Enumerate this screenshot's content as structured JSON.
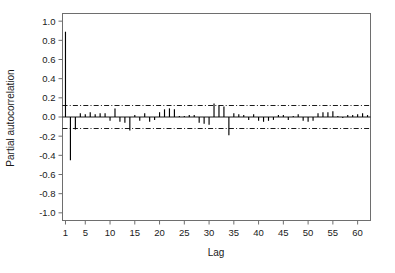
{
  "chart_data": {
    "type": "bar",
    "title": "",
    "xlabel": "Lag",
    "ylabel": "Partial autocorrelation",
    "xlim": [
      0.4,
      62.6
    ],
    "ylim": [
      -1.08,
      1.08
    ],
    "grid": false,
    "legend": null,
    "xticks": [
      1,
      5,
      10,
      15,
      20,
      25,
      30,
      35,
      40,
      45,
      50,
      55,
      60
    ],
    "xticklabels": [
      "1",
      "5",
      "10",
      "15",
      "20",
      "25",
      "30",
      "35",
      "40",
      "45",
      "50",
      "55",
      "60"
    ],
    "yticks": [
      1.0,
      0.8,
      0.6,
      0.4,
      0.2,
      0.0,
      -0.2,
      -0.4,
      -0.6,
      -0.8,
      -1.0
    ],
    "yticklabels": [
      "1.0",
      "0.8",
      "0.6",
      "0.4",
      "0.2",
      "0.0",
      "-0.2",
      "-0.4",
      "-0.6",
      "-0.8",
      "-1.0"
    ],
    "confidence_bounds": [
      0.12,
      -0.12
    ],
    "confidence_style": "dash-dot",
    "series_color": "#000000",
    "categories": [
      1,
      2,
      3,
      4,
      5,
      6,
      7,
      8,
      9,
      10,
      11,
      12,
      13,
      14,
      15,
      16,
      17,
      18,
      19,
      20,
      21,
      22,
      23,
      24,
      25,
      26,
      27,
      28,
      29,
      30,
      31,
      32,
      33,
      34,
      35,
      36,
      37,
      38,
      39,
      40,
      41,
      42,
      43,
      44,
      45,
      46,
      47,
      48,
      49,
      50,
      51,
      52,
      53,
      54,
      55,
      56,
      57,
      58,
      59,
      60,
      61,
      62
    ],
    "values": [
      0.89,
      -0.45,
      -0.13,
      0.04,
      0.03,
      0.05,
      0.03,
      0.04,
      0.04,
      -0.04,
      0.09,
      -0.05,
      -0.06,
      -0.14,
      0.02,
      -0.04,
      0.04,
      -0.05,
      -0.03,
      0.05,
      0.08,
      0.09,
      0.08,
      0.01,
      0.01,
      0.02,
      0.02,
      -0.06,
      -0.07,
      -0.08,
      0.14,
      0.12,
      0.11,
      -0.19,
      0.04,
      0.03,
      0.02,
      -0.03,
      0.03,
      -0.04,
      -0.05,
      -0.04,
      -0.03,
      0.02,
      0.02,
      -0.03,
      0.01,
      0.03,
      -0.04,
      -0.05,
      -0.04,
      0.04,
      0.05,
      0.05,
      0.06,
      0.01,
      -0.01,
      0.02,
      0.02,
      0.03,
      0.04,
      0.02
    ]
  },
  "axes": {
    "y_title": "Partial autocorrelation",
    "x_title": "Lag"
  }
}
